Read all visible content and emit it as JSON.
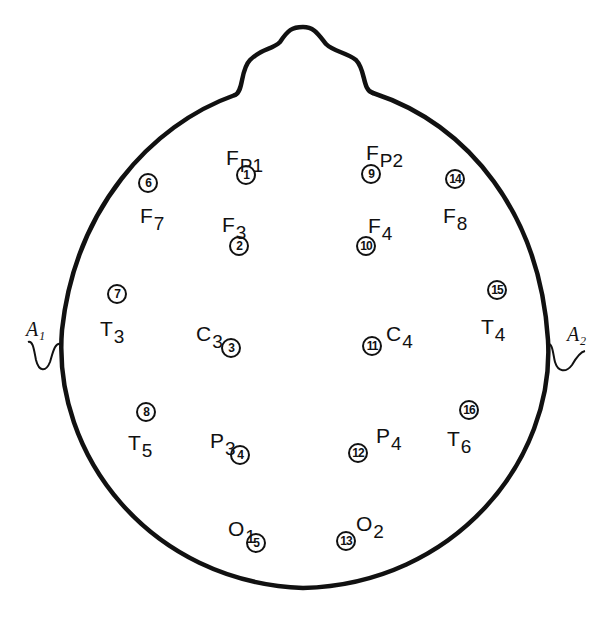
{
  "colors": {
    "ink": "#111111",
    "background": "#ffffff"
  },
  "ears": [
    {
      "label": "A₁",
      "side": "left"
    },
    {
      "label": "A₂",
      "side": "right"
    }
  ],
  "electrodes": [
    {
      "name": "FP1",
      "base": "F",
      "sub": "P1",
      "number": "1",
      "lx": 226,
      "ly": 147,
      "cx": 246,
      "cy": 175
    },
    {
      "name": "FP2",
      "base": "F",
      "sub": "P2",
      "number": "9",
      "lx": 366,
      "ly": 142,
      "cx": 371,
      "cy": 174
    },
    {
      "name": "F7",
      "base": "F",
      "sub": "7",
      "number": "6",
      "lx": 140,
      "ly": 205,
      "cx": 148,
      "cy": 183
    },
    {
      "name": "F3",
      "base": "F",
      "sub": "3",
      "number": "2",
      "lx": 222,
      "ly": 214,
      "cx": 239,
      "cy": 246
    },
    {
      "name": "F4",
      "base": "F",
      "sub": "4",
      "number": "10",
      "lx": 368,
      "ly": 215,
      "cx": 366,
      "cy": 246
    },
    {
      "name": "F8",
      "base": "F",
      "sub": "8",
      "number": "14",
      "lx": 443,
      "ly": 205,
      "cx": 455,
      "cy": 179
    },
    {
      "name": "T3",
      "base": "T",
      "sub": "3",
      "number": "7",
      "lx": 100,
      "ly": 318,
      "cx": 117,
      "cy": 294
    },
    {
      "name": "C3",
      "base": "C",
      "sub": "3",
      "number": "3",
      "lx": 196,
      "ly": 323,
      "cx": 231,
      "cy": 348
    },
    {
      "name": "C4",
      "base": "C",
      "sub": "4",
      "number": "11",
      "lx": 386,
      "ly": 323,
      "cx": 372,
      "cy": 346
    },
    {
      "name": "T4",
      "base": "T",
      "sub": "4",
      "number": "15",
      "lx": 481,
      "ly": 316,
      "cx": 497,
      "cy": 290
    },
    {
      "name": "T5",
      "base": "T",
      "sub": "5",
      "number": "8",
      "lx": 128,
      "ly": 432,
      "cx": 146,
      "cy": 412
    },
    {
      "name": "P3",
      "base": "P",
      "sub": "3",
      "number": "4",
      "lx": 210,
      "ly": 430,
      "cx": 240,
      "cy": 455
    },
    {
      "name": "P4",
      "base": "P",
      "sub": "4",
      "number": "12",
      "lx": 376,
      "ly": 425,
      "cx": 358,
      "cy": 453
    },
    {
      "name": "T6",
      "base": "T",
      "sub": "6",
      "number": "16",
      "lx": 447,
      "ly": 428,
      "cx": 469,
      "cy": 410
    },
    {
      "name": "O1",
      "base": "O",
      "sub": "1",
      "number": "5",
      "lx": 228,
      "ly": 518,
      "cx": 256,
      "cy": 543
    },
    {
      "name": "O2",
      "base": "O",
      "sub": "2",
      "number": "13",
      "lx": 356,
      "ly": 513,
      "cx": 346,
      "cy": 541
    }
  ]
}
